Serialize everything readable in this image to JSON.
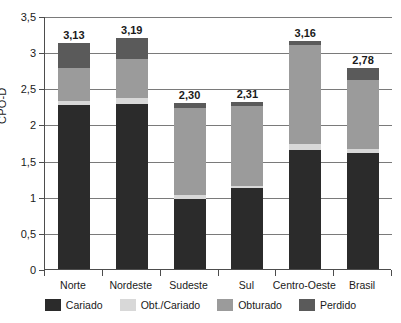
{
  "chart_data": {
    "type": "bar",
    "stacked": true,
    "title": "",
    "xlabel": "",
    "ylabel": "CPO-D",
    "ylim": [
      0,
      3.5
    ],
    "ytick_labels": [
      "0",
      "0,5",
      "1",
      "1,5",
      "2",
      "2,5",
      "3",
      "3,5"
    ],
    "ytick_values": [
      0,
      0.5,
      1,
      1.5,
      2,
      2.5,
      3,
      3.5
    ],
    "grid": true,
    "legend_position": "bottom",
    "categories": [
      "Norte",
      "Nordeste",
      "Sudeste",
      "Sul",
      "Centro-Oeste",
      "Brasil"
    ],
    "series": [
      {
        "name": "Cariado",
        "color": "#2b2b2b",
        "values": [
          2.27,
          2.28,
          0.97,
          1.12,
          1.65,
          1.6
        ]
      },
      {
        "name": "Obt./Cariado",
        "color": "#d8d8d8",
        "values": [
          0.06,
          0.08,
          0.06,
          0.03,
          0.08,
          0.06
        ]
      },
      {
        "name": "Obturado",
        "color": "#9b9b9b",
        "values": [
          0.45,
          0.54,
          1.2,
          1.11,
          1.37,
          0.96
        ]
      },
      {
        "name": "Perdido",
        "color": "#5a5a5a",
        "values": [
          0.35,
          0.29,
          0.07,
          0.05,
          0.06,
          0.16
        ]
      }
    ],
    "totals": [
      3.13,
      3.19,
      2.3,
      2.31,
      3.16,
      2.78
    ],
    "total_labels": [
      "3,13",
      "3,19",
      "2,30",
      "2,31",
      "3,16",
      "2,78"
    ]
  },
  "legend": {
    "items": [
      {
        "label": "Cariado",
        "color": "#2b2b2b"
      },
      {
        "label": "Obt./Cariado",
        "color": "#d8d8d8"
      },
      {
        "label": "Obturado",
        "color": "#9b9b9b"
      },
      {
        "label": "Perdido",
        "color": "#5a5a5a"
      }
    ]
  },
  "axis": {
    "y_title": "CPO-D"
  }
}
